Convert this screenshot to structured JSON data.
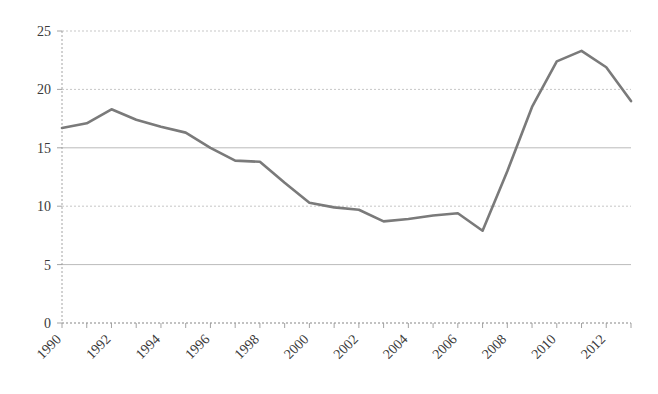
{
  "chart_data": {
    "type": "line",
    "title": "",
    "subtitle": "",
    "xlabel": "",
    "ylabel": "",
    "x": [
      1990,
      1991,
      1992,
      1993,
      1994,
      1995,
      1996,
      1997,
      1998,
      1999,
      2000,
      2001,
      2002,
      2003,
      2004,
      2005,
      2006,
      2007,
      2008,
      2009,
      2010,
      2011,
      2012,
      2013
    ],
    "values": [
      16.7,
      17.1,
      18.3,
      17.4,
      16.8,
      16.3,
      15.0,
      13.9,
      13.8,
      12.0,
      10.3,
      9.9,
      9.7,
      8.7,
      8.9,
      9.2,
      9.4,
      7.9,
      13.0,
      18.5,
      22.4,
      23.3,
      21.9,
      19.0
    ],
    "series": [
      {
        "name": "",
        "values": [
          16.7,
          17.1,
          18.3,
          17.4,
          16.8,
          16.3,
          15.0,
          13.9,
          13.8,
          12.0,
          10.3,
          9.9,
          9.7,
          8.7,
          8.9,
          9.2,
          9.4,
          7.9,
          13.0,
          18.5,
          22.4,
          23.3,
          21.9,
          19.0
        ],
        "color": "#7a7a7a"
      }
    ],
    "ylim": [
      0,
      25
    ],
    "yticks": [
      0,
      5,
      10,
      15,
      20,
      25
    ],
    "ytick_labels": [
      "0",
      "5",
      "10",
      "15",
      "20",
      "25"
    ],
    "xtick_labels": [
      "1990",
      "1992",
      "1994",
      "1996",
      "1998",
      "2000",
      "2002",
      "2004",
      "2006",
      "2008",
      "2010",
      "2012"
    ],
    "xtick_label_years": [
      1990,
      1992,
      1994,
      1996,
      1998,
      2000,
      2002,
      2004,
      2006,
      2008,
      2010,
      2012
    ],
    "xtick_label_rotation": -45,
    "grid": true,
    "grid_axis": "y",
    "legend": false,
    "legend_position": "none",
    "line_color": "#7a7a7a",
    "grid_color": "#b9b9b9",
    "axis_color": "#8d8d8d",
    "background_color": "#ffffff",
    "annotations": []
  }
}
